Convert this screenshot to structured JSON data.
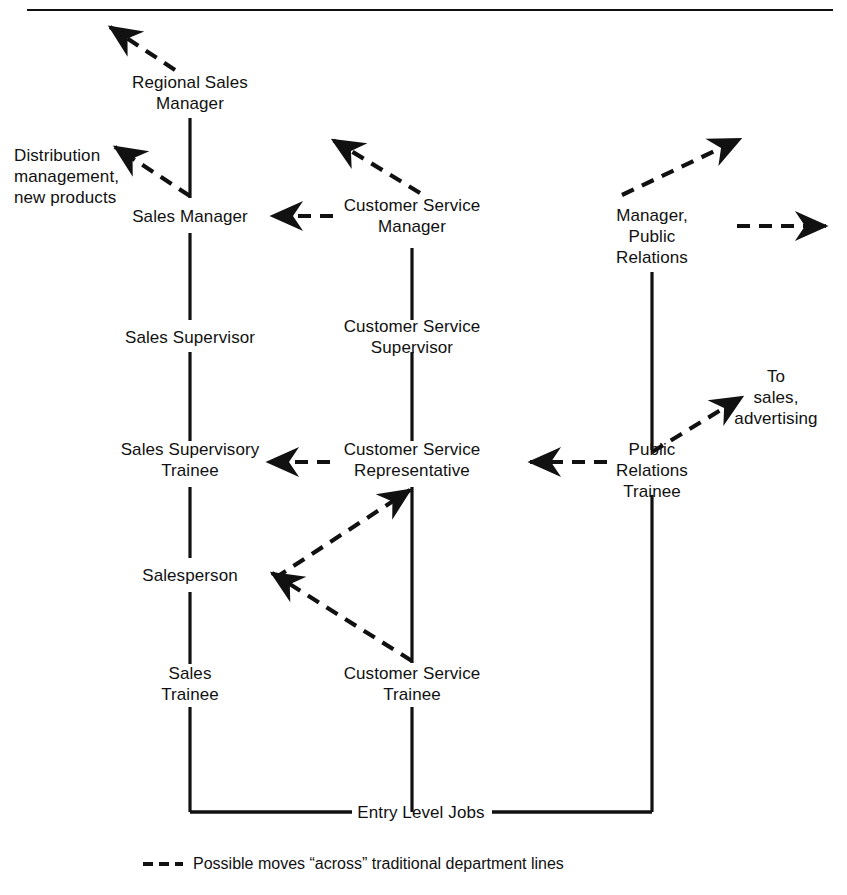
{
  "diagram": {
    "colors": {
      "ink": "#111111",
      "background": "#ffffff"
    },
    "columns": [
      {
        "name": "sales",
        "x": 190
      },
      {
        "name": "customer-service",
        "x": 412
      },
      {
        "name": "public-relations",
        "x": 652
      }
    ],
    "nodes": [
      {
        "id": "regional-sales-manager",
        "label": "Regional Sales\nManager",
        "x": 190,
        "y": 93,
        "column": "sales"
      },
      {
        "id": "sales-manager",
        "label": "Sales Manager",
        "x": 190,
        "y": 216,
        "column": "sales"
      },
      {
        "id": "sales-supervisor",
        "label": "Sales Supervisor",
        "x": 190,
        "y": 337,
        "column": "sales"
      },
      {
        "id": "sales-supervisory-trainee",
        "label": "Sales Supervisory\nTrainee",
        "x": 190,
        "y": 460,
        "column": "sales"
      },
      {
        "id": "salesperson",
        "label": "Salesperson",
        "x": 190,
        "y": 575,
        "column": "sales"
      },
      {
        "id": "sales-trainee",
        "label": "Sales\nTrainee",
        "x": 190,
        "y": 684,
        "column": "sales"
      },
      {
        "id": "customer-service-manager",
        "label": "Customer Service\nManager",
        "x": 412,
        "y": 216,
        "column": "customer-service"
      },
      {
        "id": "customer-service-supervisor",
        "label": "Customer Service\nSupervisor",
        "x": 412,
        "y": 337,
        "column": "customer-service"
      },
      {
        "id": "customer-service-representative",
        "label": "Customer Service\nRepresentative",
        "x": 412,
        "y": 460,
        "column": "customer-service"
      },
      {
        "id": "customer-service-trainee",
        "label": "Customer Service\nTrainee",
        "x": 412,
        "y": 684,
        "column": "customer-service"
      },
      {
        "id": "manager-public-relations",
        "label": "Manager,\nPublic\nRelations",
        "x": 652,
        "y": 236,
        "column": "public-relations"
      },
      {
        "id": "public-relations-trainee",
        "label": "Public\nRelations\nTrainee",
        "x": 652,
        "y": 470,
        "column": "public-relations"
      },
      {
        "id": "entry-level-jobs",
        "label": "Entry Level Jobs",
        "x": 421,
        "y": 812,
        "column": "base"
      }
    ],
    "exit_labels": [
      {
        "id": "distribution-management",
        "label": "Distribution\nmanagement,\nnew products",
        "x": 14,
        "y": 176,
        "align": "left"
      },
      {
        "id": "to-sales-advertising",
        "label": "To\nsales,\nadvertising",
        "x": 776,
        "y": 397,
        "align": "center"
      }
    ],
    "solid_edges": [
      {
        "from": "regional-sales-manager",
        "to": "sales-manager",
        "x": 190,
        "y1": 118,
        "y2": 198
      },
      {
        "from": "sales-manager",
        "to": "sales-supervisor",
        "x": 190,
        "y1": 233,
        "y2": 320
      },
      {
        "from": "sales-supervisor",
        "to": "sales-supervisory-trainee",
        "x": 190,
        "y1": 352,
        "y2": 441
      },
      {
        "from": "sales-supervisory-trainee",
        "to": "salesperson",
        "x": 190,
        "y1": 487,
        "y2": 558
      },
      {
        "from": "salesperson",
        "to": "sales-trainee",
        "x": 190,
        "y1": 592,
        "y2": 664
      },
      {
        "from": "sales-trainee",
        "to": "entry-level-jobs",
        "x": 190,
        "y1": 707,
        "y2": 812
      },
      {
        "from": "customer-service-manager",
        "to": "customer-service-supervisor",
        "x": 412,
        "y1": 248,
        "y2": 320
      },
      {
        "from": "customer-service-supervisor",
        "to": "customer-service-representative",
        "x": 412,
        "y1": 352,
        "y2": 441
      },
      {
        "from": "customer-service-representative",
        "to": "customer-service-trainee",
        "x": 412,
        "y1": 487,
        "y2": 663
      },
      {
        "from": "customer-service-trainee",
        "to": "entry-level-jobs",
        "x": 412,
        "y1": 707,
        "y2": 812
      },
      {
        "from": "manager-public-relations",
        "to": "public-relations-trainee",
        "x": 652,
        "y1": 272,
        "y2": 450
      },
      {
        "from": "public-relations-trainee",
        "to": "entry-level-jobs",
        "x": 652,
        "y1": 495,
        "y2": 812
      }
    ],
    "base_bar": {
      "y": 812,
      "x1": 190,
      "x2": 652,
      "gap_x1": 352,
      "gap_x2": 492
    },
    "dashed_edges": [
      {
        "id": "regional-sales-manager-up",
        "note": "from Regional Sales Manager up-left off-chart",
        "x1": 175,
        "y1": 70,
        "x2": 110,
        "y2": 27
      },
      {
        "id": "sales-manager-to-distribution",
        "note": "from Sales Manager up-left to Distribution management, new products",
        "x1": 190,
        "y1": 196,
        "x2": 115,
        "y2": 147
      },
      {
        "id": "customer-service-manager-up",
        "note": "from Customer Service Manager up-left off-chart",
        "x1": 420,
        "y1": 193,
        "x2": 333,
        "y2": 140
      },
      {
        "id": "customer-service-manager-to-sales-manager",
        "note": "horizontal from Customer Service Manager to Sales Manager",
        "x1": 333,
        "y1": 216,
        "x2": 272,
        "y2": 216
      },
      {
        "id": "manager-public-relations-up",
        "note": "from Manager, Public Relations up-right off-chart",
        "x1": 622,
        "y1": 195,
        "x2": 740,
        "y2": 139
      },
      {
        "id": "manager-public-relations-right",
        "note": "horizontal right from Manager, Public Relations off-chart",
        "x1": 737,
        "y1": 226,
        "x2": 826,
        "y2": 226
      },
      {
        "id": "public-relations-trainee-to-sales-advertising",
        "note": "from Public Relations Trainee up-right to To sales, advertising",
        "x1": 652,
        "y1": 452,
        "x2": 742,
        "y2": 397
      },
      {
        "id": "public-relations-trainee-to-cs-representative",
        "note": "horizontal from Public Relations Trainee to Customer Service Representative",
        "x1": 607,
        "y1": 462,
        "x2": 530,
        "y2": 462
      },
      {
        "id": "cs-representative-to-sales-supervisory-trainee",
        "note": "horizontal from Customer Service Representative to Sales Supervisory Trainee",
        "x1": 330,
        "y1": 462,
        "x2": 268,
        "y2": 462
      },
      {
        "id": "salesperson-to-cs-representative",
        "note": "diagonal up-right from Salesperson to Customer Service Representative",
        "x1": 275,
        "y1": 578,
        "x2": 410,
        "y2": 490
      },
      {
        "id": "cs-trainee-to-salesperson",
        "note": "diagonal up-left from Customer Service Trainee to Salesperson",
        "x1": 412,
        "y1": 661,
        "x2": 272,
        "y2": 573
      }
    ],
    "legend": {
      "dash_symbol": "---",
      "text": "Possible moves “across” traditional department lines"
    },
    "top_rule": {
      "y": 10,
      "x1": 27,
      "x2": 833
    }
  }
}
